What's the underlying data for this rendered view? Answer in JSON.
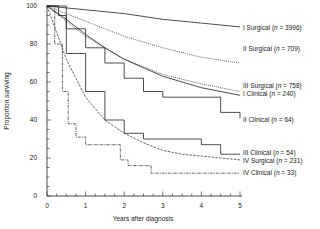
{
  "chart_data": {
    "type": "line",
    "title": "",
    "xlabel": "Years after diagnosis",
    "ylabel": "Proportion surviving",
    "xlim": [
      0,
      5
    ],
    "ylim": [
      0,
      100
    ],
    "x_ticks": [
      "0",
      "1",
      "2",
      "3",
      "4",
      "5"
    ],
    "y_ticks": [
      "0",
      "20",
      "40",
      "60",
      "80",
      "100"
    ],
    "grid": false,
    "legend_position": "right, inline labels at curve ends",
    "series": [
      {
        "name": "I Surgical",
        "n": "3996",
        "label": "I Surgical (n = 3996)",
        "style": "solid",
        "x": [
          0,
          1,
          2,
          3,
          4,
          5
        ],
        "values": [
          100,
          98,
          96,
          93,
          91,
          89
        ]
      },
      {
        "name": "II Surgical",
        "n": "709",
        "label": "II Surgical (n = 709)",
        "style": "dotted",
        "x": [
          0,
          0.5,
          1,
          2,
          3,
          4,
          5
        ],
        "values": [
          100,
          96,
          92,
          84,
          78,
          73,
          70
        ]
      },
      {
        "name": "III Surgical",
        "n": "758",
        "label": "III Surgical (n = 758)",
        "style": "dotted",
        "x": [
          0,
          0.5,
          1,
          1.5,
          2,
          3,
          4,
          5
        ],
        "values": [
          100,
          92,
          84,
          78,
          72,
          64,
          59,
          55
        ]
      },
      {
        "name": "I Clinical",
        "n": "240",
        "label": "I Clinical (n = 240)",
        "style": "solid",
        "x": [
          0,
          0.5,
          1,
          1.5,
          2,
          3,
          4,
          5
        ],
        "values": [
          100,
          93,
          85,
          78,
          72,
          63,
          57,
          53
        ]
      },
      {
        "name": "II Clinical",
        "n": "64",
        "label": "II Clinical (n = 64)",
        "style": "solid-step",
        "x": [
          0,
          0.3,
          0.5,
          1,
          1.5,
          2,
          2.5,
          3,
          3.5,
          4,
          4.5,
          5
        ],
        "values": [
          100,
          95,
          88,
          78,
          70,
          62,
          55,
          52,
          52,
          52,
          44,
          41
        ]
      },
      {
        "name": "III Clinical",
        "n": "54",
        "label": "III Clinical (n = 54)",
        "style": "solid-step",
        "x": [
          0,
          0.5,
          1,
          1.5,
          2,
          2.5,
          3,
          3.5,
          4,
          4.5,
          5
        ],
        "values": [
          100,
          75,
          55,
          40,
          33,
          30,
          30,
          30,
          27,
          22,
          22
        ]
      },
      {
        "name": "IV Surgical",
        "n": "231",
        "label": "IV Surgical (n = 231)",
        "style": "dashed",
        "x": [
          0,
          0.5,
          1,
          1.5,
          2,
          2.5,
          3,
          3.5,
          4,
          4.5,
          5
        ],
        "values": [
          100,
          72,
          52,
          40,
          33,
          28,
          24,
          22,
          21,
          20,
          19
        ]
      },
      {
        "name": "IV Clinical",
        "n": "33",
        "label": "IV Clinical (n = 33)",
        "style": "dash-dot-step",
        "x": [
          0,
          0.2,
          0.4,
          0.55,
          0.75,
          1.0,
          1.9,
          2.1,
          2.7,
          5
        ],
        "values": [
          100,
          80,
          55,
          38,
          31,
          27,
          19,
          16,
          12,
          12
        ]
      }
    ]
  }
}
